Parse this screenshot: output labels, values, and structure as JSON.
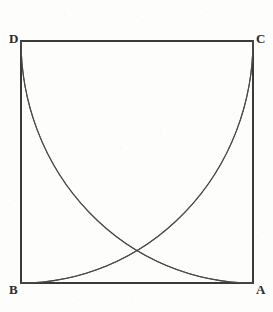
{
  "figure": {
    "background_color": "#fdfdfc",
    "square": {
      "stroke_color": "#3a3a3a",
      "stroke_width": 2,
      "x": 21,
      "y": 41,
      "width": 232,
      "height": 242,
      "vertices": [
        {
          "name": "A",
          "label": "A",
          "x": 253,
          "y": 283,
          "position": "bottom-right"
        },
        {
          "name": "B",
          "label": "B",
          "x": 21,
          "y": 283,
          "position": "bottom-left"
        },
        {
          "name": "C",
          "label": "C",
          "x": 253,
          "y": 41,
          "position": "top-right"
        },
        {
          "name": "D",
          "label": "D",
          "x": 21,
          "y": 41,
          "position": "top-left"
        }
      ]
    },
    "arcs": {
      "stroke_color": "#4a4a4a",
      "stroke_width": 1.1,
      "count": 4,
      "description": "Each arc is a quarter circle centered at one vertex with radius equal to the side of the square, running between the two adjacent vertices.",
      "items": [
        {
          "name": "arc-centered-at-A",
          "center": "A",
          "from": "B",
          "to": "C",
          "path": "M 21 283 A 232 242 0 0 0 253 41"
        },
        {
          "name": "arc-centered-at-B",
          "center": "B",
          "from": "A",
          "to": "D",
          "path": "M 253 283 A 232 242 0 0 1 21 41"
        },
        {
          "name": "arc-centered-at-C",
          "center": "C",
          "from": "D",
          "to": "A",
          "path": "M 21 41 A 232 242 0 0 0 253 283"
        },
        {
          "name": "arc-centered-at-D",
          "center": "D",
          "from": "C",
          "to": "B",
          "path": "M 253 41 A 232 242 0 0 1 21 283"
        }
      ]
    },
    "intersections": [
      {
        "name": "top-intersection",
        "x": 137,
        "y": 72
      },
      {
        "name": "left-intersection",
        "x": 55,
        "y": 162
      },
      {
        "name": "right-intersection",
        "x": 222,
        "y": 162
      },
      {
        "name": "bottom-intersection",
        "x": 137,
        "y": 252
      }
    ]
  },
  "chart_data": {
    "type": "diagram",
    "shapes": [
      {
        "kind": "square",
        "label": "ABCD",
        "corners": {
          "A": [
            253,
            283
          ],
          "B": [
            21,
            283
          ],
          "C": [
            253,
            41
          ],
          "D": [
            21,
            41
          ]
        }
      },
      {
        "kind": "arc",
        "center": "A",
        "endpoints": [
          "B",
          "C"
        ]
      },
      {
        "kind": "arc",
        "center": "B",
        "endpoints": [
          "A",
          "D"
        ]
      },
      {
        "kind": "arc",
        "center": "C",
        "endpoints": [
          "D",
          "A"
        ]
      },
      {
        "kind": "arc",
        "center": "D",
        "endpoints": [
          "C",
          "B"
        ]
      }
    ],
    "labels": [
      "A",
      "B",
      "C",
      "D"
    ]
  },
  "speckles": [
    {
      "x": 64,
      "y": 14,
      "s": 1
    },
    {
      "x": 137,
      "y": 16,
      "s": 1
    },
    {
      "x": 206,
      "y": 12,
      "s": 1
    },
    {
      "x": 36,
      "y": 106,
      "s": 1
    },
    {
      "x": 249,
      "y": 118,
      "s": 1
    },
    {
      "x": 120,
      "y": 148,
      "s": 1
    },
    {
      "x": 160,
      "y": 130,
      "s": 1
    },
    {
      "x": 78,
      "y": 300,
      "s": 1
    },
    {
      "x": 131,
      "y": 299,
      "s": 1
    },
    {
      "x": 178,
      "y": 301,
      "s": 1
    },
    {
      "x": 14,
      "y": 200,
      "s": 1
    },
    {
      "x": 262,
      "y": 232,
      "s": 1
    }
  ]
}
